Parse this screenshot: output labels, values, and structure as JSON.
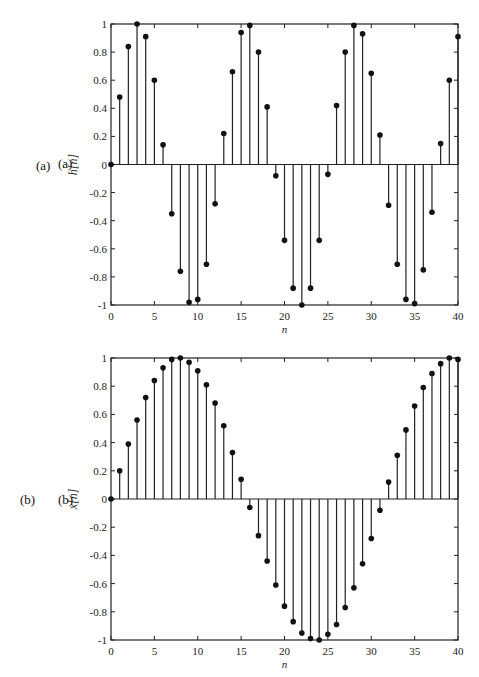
{
  "chart_data": [
    {
      "type": "stem",
      "panel_label": "(a)",
      "inner_label": "(a)",
      "title": "",
      "xlabel": "n",
      "ylabel": "h[n]",
      "xlim": [
        0,
        40
      ],
      "ylim": [
        -1,
        1
      ],
      "xticks": [
        0,
        5,
        10,
        15,
        20,
        25,
        30,
        35,
        40
      ],
      "yticks": [
        1,
        0.8,
        0.6,
        0.4,
        0.2,
        0,
        -0.2,
        -0.4,
        -0.6,
        -0.8,
        -1
      ],
      "ytick_labels": [
        "1",
        "0.8",
        "0.6",
        "0.4",
        "0.2",
        "0",
        "-0.2",
        "-0.4",
        "-0.6",
        "-0.8",
        "-1"
      ],
      "grid": false,
      "x": [
        0,
        1,
        2,
        3,
        4,
        5,
        6,
        7,
        8,
        9,
        10,
        11,
        12,
        13,
        14,
        15,
        16,
        17,
        18,
        19,
        20,
        21,
        22,
        23,
        24,
        25,
        26,
        27,
        28,
        29,
        30,
        31,
        32,
        33,
        34,
        35,
        36,
        37,
        38,
        39,
        40
      ],
      "values": [
        0,
        0.48,
        0.84,
        1.0,
        0.91,
        0.6,
        0.14,
        -0.35,
        -0.76,
        -0.98,
        -0.96,
        -0.71,
        -0.28,
        0.22,
        0.66,
        0.94,
        0.99,
        0.8,
        0.41,
        -0.08,
        -0.54,
        -0.88,
        -1.0,
        -0.88,
        -0.54,
        -0.07,
        0.42,
        0.8,
        0.99,
        0.93,
        0.65,
        0.21,
        -0.29,
        -0.71,
        -0.96,
        -0.99,
        -0.75,
        -0.34,
        0.15,
        0.6,
        0.91
      ]
    },
    {
      "type": "stem",
      "panel_label": "(b)",
      "inner_label": "(b)",
      "title": "",
      "xlabel": "n",
      "ylabel": "x[n]",
      "xlim": [
        0,
        40
      ],
      "ylim": [
        -1,
        1
      ],
      "xticks": [
        0,
        5,
        10,
        15,
        20,
        25,
        30,
        35,
        40
      ],
      "yticks": [
        1,
        0.8,
        0.6,
        0.4,
        0.2,
        0,
        -0.2,
        -0.4,
        -0.6,
        -0.8,
        -1
      ],
      "ytick_labels": [
        "1",
        "0.8",
        "0.6",
        "0.4",
        "0.2",
        "0",
        "-0.2",
        "-0.4",
        "-0.6",
        "-0.8",
        "-1"
      ],
      "grid": false,
      "x": [
        0,
        1,
        2,
        3,
        4,
        5,
        6,
        7,
        8,
        9,
        10,
        11,
        12,
        13,
        14,
        15,
        16,
        17,
        18,
        19,
        20,
        21,
        22,
        23,
        24,
        25,
        26,
        27,
        28,
        29,
        30,
        31,
        32,
        33,
        34,
        35,
        36,
        37,
        38,
        39,
        40
      ],
      "values": [
        0,
        0.2,
        0.39,
        0.56,
        0.72,
        0.84,
        0.93,
        0.99,
        1.0,
        0.97,
        0.91,
        0.81,
        0.68,
        0.52,
        0.33,
        0.14,
        -0.06,
        -0.26,
        -0.44,
        -0.61,
        -0.76,
        -0.87,
        -0.95,
        -0.99,
        -1.0,
        -0.96,
        -0.89,
        -0.77,
        -0.63,
        -0.46,
        -0.28,
        -0.08,
        0.12,
        0.31,
        0.49,
        0.66,
        0.79,
        0.89,
        0.96,
        1.0,
        0.99
      ]
    }
  ]
}
